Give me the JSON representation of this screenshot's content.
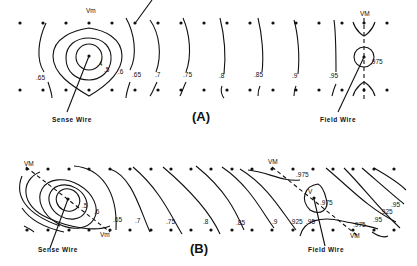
{
  "figure": {
    "panel_a": {
      "label": "(A)",
      "sense_wire_label": "Sense Wire",
      "field_wire_label": "Field Wire",
      "vm_left": "Vm",
      "vm_right": "VM",
      "contour_labels": [
        ".4",
        ".5",
        ".6",
        ".65",
        ".65",
        ".7",
        ".75",
        ".8",
        ".85",
        ".9",
        ".95",
        ".975"
      ]
    },
    "panel_b": {
      "label": "(B)",
      "sense_wire_label": "Sense Wire",
      "field_wire_label": "Field Wire",
      "vm_top_left": "VM",
      "vm_bottom_left": "Vm",
      "vm_top_right": "VM",
      "vm_bottom_right": "VM",
      "vm_center": "V",
      "contour_labels": [
        ".5",
        ".6",
        ".65",
        ".7",
        ".75",
        ".8",
        ".85",
        ".9",
        ".925",
        ".95",
        ".975",
        ".975",
        ".975",
        ".95",
        ".925",
        ".95"
      ]
    }
  }
}
